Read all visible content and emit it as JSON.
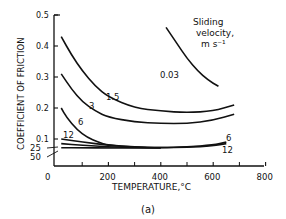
{
  "chart_data": {
    "type": "line",
    "title": "",
    "subtitle": "(a)",
    "xlabel": "TEMPERATURE,°C",
    "ylabel": "COEFFICIENT OF FRICTION",
    "xlim": [
      0,
      800
    ],
    "ylim": [
      0,
      0.5
    ],
    "x_ticks": [
      0,
      200,
      400,
      600,
      800
    ],
    "x_tick_labels": [
      "0",
      "200",
      "400",
      "600",
      "800"
    ],
    "y_ticks": [
      0.1,
      0.2,
      0.3,
      0.4,
      0.5
    ],
    "y_tick_labels": [
      "0.1",
      "0.2",
      "0.3",
      "0.4",
      "0.5"
    ],
    "grid": false,
    "legend": {
      "title_line1": "Sliding",
      "title_line2": "velocity,",
      "title_line3": "m s⁻¹",
      "position": "upper-right"
    },
    "series": [
      {
        "name": "0.03",
        "x": [
          420,
          460,
          500,
          540,
          580,
          620
        ],
        "y": [
          0.46,
          0.41,
          0.36,
          0.32,
          0.29,
          0.27
        ]
      },
      {
        "name": "1.5",
        "x": [
          20,
          60,
          100,
          150,
          200,
          300,
          400,
          500,
          600,
          680
        ],
        "y": [
          0.43,
          0.37,
          0.32,
          0.27,
          0.235,
          0.2,
          0.19,
          0.185,
          0.19,
          0.21
        ]
      },
      {
        "name": "3",
        "x": [
          20,
          60,
          100,
          150,
          200,
          300,
          400,
          500,
          600,
          680
        ],
        "y": [
          0.31,
          0.26,
          0.22,
          0.19,
          0.17,
          0.155,
          0.15,
          0.15,
          0.16,
          0.18
        ]
      },
      {
        "name": "6",
        "x": [
          20,
          40,
          80,
          120,
          160,
          200,
          300,
          400,
          500,
          600,
          650
        ],
        "y": [
          0.2,
          0.17,
          0.13,
          0.105,
          0.09,
          0.08,
          0.075,
          0.072,
          0.075,
          0.08,
          0.09
        ]
      },
      {
        "name": "12",
        "x": [
          20,
          100,
          200,
          300,
          400,
          500,
          600,
          650
        ],
        "y": [
          0.1,
          0.09,
          0.08,
          0.073,
          0.072,
          0.073,
          0.078,
          0.085
        ]
      },
      {
        "name": "25",
        "x": [
          20,
          100,
          200,
          300,
          400
        ],
        "y": [
          0.085,
          0.08,
          0.075,
          0.072,
          0.072
        ]
      },
      {
        "name": "50",
        "x": [
          20,
          100,
          200,
          300,
          400
        ],
        "y": [
          0.072,
          0.072,
          0.071,
          0.071,
          0.071
        ]
      }
    ]
  }
}
